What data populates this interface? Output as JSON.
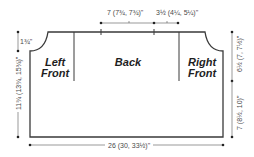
{
  "diagram": {
    "type": "knitting-schematic",
    "panels": {
      "left_front": "Left\nFront",
      "back": "Back",
      "right_front": "Right\nFront"
    },
    "panel_lines": {
      "left_front_1": "Left",
      "left_front_2": "Front",
      "back": "Back",
      "right_front_1": "Right",
      "right_front_2": "Front"
    },
    "measurements": {
      "top_back_neck": "7 (7¾, 7¾)\"",
      "top_shoulder": "3½ (4¼, 5¼)\"",
      "left_neck_drop": "1¾\"",
      "left_height": "11¾ (13¾, 15¾)\"",
      "right_armhole": "6½ (7, 7½)\"",
      "right_lower": "7 (8½, 10)\"",
      "bottom_width": "26 (30, 33½)\""
    },
    "colors": {
      "line": "#3a3a3a",
      "text": "#1e1e1e",
      "measure_text": "#4a4a4a",
      "background": "#ffffff"
    }
  }
}
